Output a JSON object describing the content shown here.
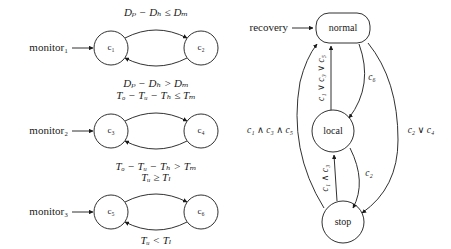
{
  "figure": {
    "left_panel": {
      "monitors": [
        {
          "source_label": "monitor₁",
          "states": [
            "c₁",
            "c₂"
          ],
          "forward_condition": "Dₚ − Dₕ ≤ Dₘ",
          "backward_condition": "Dₚ − Dₕ > Dₘ"
        },
        {
          "source_label": "monitor₂",
          "states": [
            "c₃",
            "c₄"
          ],
          "forward_condition": "Tₒ − Tᵤ − Tₕ ≤ Tₘ",
          "backward_condition": "Tₒ − Tᵤ − Tₕ > Tₘ"
        },
        {
          "source_label": "monitor₃",
          "states": [
            "c₅",
            "c₆"
          ],
          "forward_condition": "Tᵤ ≥ Tₗ",
          "backward_condition": "Tᵤ < Tₗ"
        }
      ]
    },
    "right_panel": {
      "entry_label": "recovery",
      "states": [
        {
          "id": "normal",
          "label": "normal",
          "shape": "rounded-rect"
        },
        {
          "id": "local",
          "label": "local",
          "shape": "circle"
        },
        {
          "id": "stop",
          "label": "stop",
          "shape": "circle"
        }
      ],
      "transitions": [
        {
          "from": "local",
          "to": "normal",
          "label": "c₁ ∨ c₃ ∨ c₅",
          "orientation": "vertical"
        },
        {
          "from": "normal",
          "to": "local",
          "label": "c₆",
          "orientation": "curve"
        },
        {
          "from": "stop",
          "to": "local",
          "label": "c₁ ∧ c₃",
          "orientation": "vertical"
        },
        {
          "from": "local",
          "to": "stop",
          "label": "c₂",
          "orientation": "curve"
        },
        {
          "from": "stop",
          "to": "normal",
          "label": "c₁ ∧ c₃ ∧ c₅",
          "orientation": "outer-left"
        },
        {
          "from": "normal",
          "to": "stop",
          "label": "c₂ ∨ c₄",
          "orientation": "outer-right"
        }
      ]
    }
  },
  "colors": {
    "ink": "#1a1a1a",
    "paper": "#ffffff"
  }
}
